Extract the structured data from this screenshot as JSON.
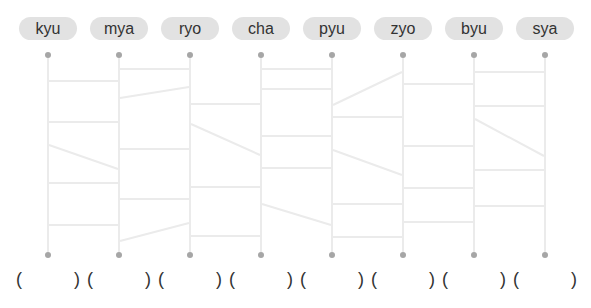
{
  "labels": [
    "kyu",
    "mya",
    "ryo",
    "cha",
    "pyu",
    "zyo",
    "byu",
    "sya"
  ],
  "answers": [
    "",
    "",
    "",
    "",
    "",
    "",
    "",
    ""
  ],
  "paren_open": "(",
  "paren_close": ")",
  "colors": {
    "pill_bg": "#e2e2e2",
    "text": "#333333",
    "line": "#ebebeb",
    "dot": "#a6a6a6"
  },
  "ladder": {
    "columns_x": [
      48,
      119,
      190,
      261,
      332,
      403,
      474,
      545
    ],
    "top_y": 55,
    "bottom_y": 255,
    "rungs": [
      {
        "gap": 0,
        "y1": 81,
        "y2": 81
      },
      {
        "gap": 0,
        "y1": 122,
        "y2": 122
      },
      {
        "gap": 0,
        "y1": 145,
        "y2": 169
      },
      {
        "gap": 0,
        "y1": 183,
        "y2": 183
      },
      {
        "gap": 0,
        "y1": 225,
        "y2": 225
      },
      {
        "gap": 1,
        "y1": 69,
        "y2": 69
      },
      {
        "gap": 1,
        "y1": 98,
        "y2": 87
      },
      {
        "gap": 1,
        "y1": 149,
        "y2": 149
      },
      {
        "gap": 1,
        "y1": 199,
        "y2": 199
      },
      {
        "gap": 1,
        "y1": 241,
        "y2": 223
      },
      {
        "gap": 2,
        "y1": 104,
        "y2": 104
      },
      {
        "gap": 2,
        "y1": 124,
        "y2": 155
      },
      {
        "gap": 2,
        "y1": 187,
        "y2": 187
      },
      {
        "gap": 2,
        "y1": 236,
        "y2": 236
      },
      {
        "gap": 3,
        "y1": 69,
        "y2": 69
      },
      {
        "gap": 3,
        "y1": 89,
        "y2": 89
      },
      {
        "gap": 3,
        "y1": 136,
        "y2": 136
      },
      {
        "gap": 3,
        "y1": 168,
        "y2": 168
      },
      {
        "gap": 3,
        "y1": 204,
        "y2": 225
      },
      {
        "gap": 4,
        "y1": 105,
        "y2": 72
      },
      {
        "gap": 4,
        "y1": 117,
        "y2": 117
      },
      {
        "gap": 4,
        "y1": 150,
        "y2": 175
      },
      {
        "gap": 4,
        "y1": 204,
        "y2": 204
      },
      {
        "gap": 4,
        "y1": 237,
        "y2": 237
      },
      {
        "gap": 5,
        "y1": 84,
        "y2": 84
      },
      {
        "gap": 5,
        "y1": 146,
        "y2": 146
      },
      {
        "gap": 5,
        "y1": 188,
        "y2": 188
      },
      {
        "gap": 5,
        "y1": 222,
        "y2": 222
      },
      {
        "gap": 6,
        "y1": 72,
        "y2": 72
      },
      {
        "gap": 6,
        "y1": 106,
        "y2": 106
      },
      {
        "gap": 6,
        "y1": 119,
        "y2": 156
      },
      {
        "gap": 6,
        "y1": 170,
        "y2": 170
      },
      {
        "gap": 6,
        "y1": 206,
        "y2": 206
      }
    ]
  }
}
